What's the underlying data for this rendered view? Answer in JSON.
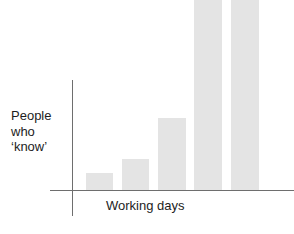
{
  "figure": {
    "width": 294,
    "height": 234,
    "background": "#ffffff"
  },
  "axes": {
    "y_label_lines": [
      "People",
      "who",
      "‘know’"
    ],
    "x_label": "Working days",
    "axis_color": "#6e6e6e"
  },
  "chart_data": {
    "type": "bar",
    "title": "",
    "subtitle": "",
    "xlabel": "Working days",
    "ylabel": "People who ‘know’",
    "categories": [
      "1",
      "2",
      "3",
      "4",
      "5"
    ],
    "values": [
      17,
      31,
      72,
      215,
      215
    ],
    "values_note": "Bar heights in pixels above the baseline; bars 4 and 5 are clipped by the top edge of the image so their true values exceed the visible extent.",
    "clipped_bars": [
      4,
      5
    ],
    "series": [
      {
        "name": "People who ‘know’",
        "values": [
          17,
          31,
          72,
          215,
          215
        ]
      }
    ],
    "bar_color": "#e4e4e4",
    "bar_geometry": [
      {
        "index": 1,
        "x": 86,
        "width": 27,
        "top": 173,
        "bottom": 190
      },
      {
        "index": 2,
        "x": 122,
        "width": 27,
        "top": 159,
        "bottom": 190
      },
      {
        "index": 3,
        "x": 158,
        "width": 28,
        "top": 118,
        "bottom": 190
      },
      {
        "index": 4,
        "x": 194,
        "width": 28,
        "top": -25,
        "bottom": 190
      },
      {
        "index": 5,
        "x": 231,
        "width": 28,
        "top": -25,
        "bottom": 190
      }
    ],
    "ylim": [
      0,
      215
    ],
    "grid": false,
    "legend": "none",
    "tick_labels_x": [],
    "tick_labels_y": [],
    "annotations": []
  }
}
